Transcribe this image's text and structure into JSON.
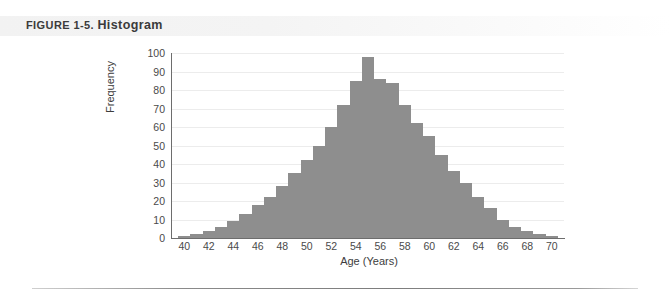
{
  "caption": {
    "label": "FIGURE 1-5.",
    "title": "Histogram"
  },
  "colors": {
    "bar": "#8e8e8e",
    "axis": "#6d6d6d",
    "gridline": "#ececec",
    "caption_band": "#f2f2f2",
    "text": "#3d3d3d"
  },
  "chart_data": {
    "type": "bar",
    "title": "Histogram",
    "xlabel": "Age (Years)",
    "ylabel": "Frequency",
    "xlim": [
      39,
      71
    ],
    "ylim": [
      0,
      100
    ],
    "xticks": [
      40,
      42,
      44,
      46,
      48,
      50,
      52,
      54,
      56,
      58,
      60,
      62,
      64,
      66,
      68,
      70
    ],
    "yticks": [
      0,
      10,
      20,
      30,
      40,
      50,
      60,
      70,
      80,
      90,
      100
    ],
    "grid": true,
    "legend": false,
    "bin_width": 1,
    "categories": [
      40,
      41,
      42,
      43,
      44,
      45,
      46,
      47,
      48,
      49,
      50,
      51,
      52,
      53,
      54,
      55,
      56,
      57,
      58,
      59,
      60,
      61,
      62,
      63,
      64,
      65,
      66,
      67,
      68,
      69,
      70
    ],
    "values": [
      1,
      2,
      4,
      6,
      9,
      13,
      18,
      22,
      28,
      35,
      42,
      50,
      60,
      72,
      85,
      98,
      86,
      84,
      72,
      62,
      55,
      45,
      36,
      30,
      22,
      16,
      10,
      6,
      4,
      2,
      1
    ]
  }
}
